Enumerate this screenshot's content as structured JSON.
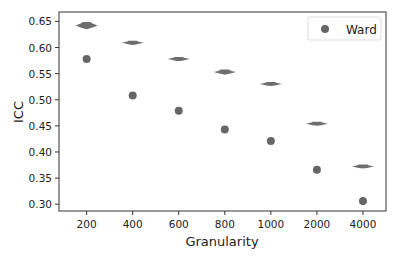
{
  "chart_data": {
    "type": "scatter",
    "title": "",
    "xlabel": "Granularity",
    "ylabel": "ICC",
    "categories": [
      "200",
      "400",
      "600",
      "800",
      "1000",
      "2000",
      "4000"
    ],
    "ylim": [
      0.287,
      0.668
    ],
    "yticks": [
      0.3,
      0.35,
      0.4,
      0.45,
      0.5,
      0.55,
      0.6,
      0.65
    ],
    "ytick_labels": [
      "0.30",
      "0.35",
      "0.40",
      "0.45",
      "0.50",
      "0.55",
      "0.60",
      "0.65"
    ],
    "grid": false,
    "legend": {
      "position": "top-right",
      "entries": [
        "Ward"
      ]
    },
    "series": [
      {
        "name": "Ward",
        "kind": "points",
        "color": "#666666",
        "values": [
          0.578,
          0.508,
          0.479,
          0.443,
          0.421,
          0.366,
          0.306
        ]
      },
      {
        "name": "distribution",
        "kind": "violin",
        "color": "#6e6e6e",
        "values": [
          0.642,
          0.609,
          0.578,
          0.553,
          0.53,
          0.454,
          0.372
        ],
        "spread": [
          0.007,
          0.004,
          0.004,
          0.005,
          0.002,
          0.002,
          0.003
        ]
      }
    ]
  }
}
